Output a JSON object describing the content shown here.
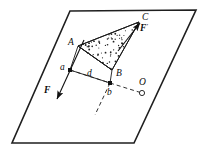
{
  "figure": {
    "background_color": "#ffffff",
    "stroke_color": "#1a1a1a",
    "canvas": {
      "width": 204,
      "height": 155
    }
  },
  "plane": {
    "name": "reference-plane",
    "shape": "parallelogram",
    "points": "70,11 196,10 134,143 12,143",
    "stroke_width": 1.6
  },
  "triangle": {
    "name": "triangle-ABC",
    "points": "78,46 112,70 139,22",
    "fill_pattern": "stipple",
    "stroke_width": 1.0
  },
  "quad": {
    "name": "quadrilateral-A-a-b-B",
    "points": "78,46 70,70 110,83 112,70",
    "stroke_width": 0.9
  },
  "points": [
    {
      "id": "A",
      "label": "A",
      "x": 78,
      "y": 46,
      "label_x": 68,
      "label_y": 45,
      "marker": "none"
    },
    {
      "id": "B",
      "label": "B",
      "x": 112,
      "y": 70,
      "label_x": 116,
      "label_y": 76,
      "marker": "none"
    },
    {
      "id": "C",
      "label": "C",
      "x": 139,
      "y": 22,
      "label_x": 142,
      "label_y": 20,
      "marker": "none"
    },
    {
      "id": "a",
      "label": "a",
      "x": 70,
      "y": 70,
      "label_x": 60,
      "label_y": 70,
      "marker": "filled-dot"
    },
    {
      "id": "b",
      "label": "b",
      "x": 110,
      "y": 83,
      "label_x": 107,
      "label_y": 95,
      "marker": "filled-dot"
    },
    {
      "id": "O",
      "label": "O",
      "x": 142,
      "y": 93,
      "label_x": 139,
      "label_y": 85,
      "marker": "open-circle"
    }
  ],
  "segments": {
    "distance_label": "d",
    "distance_label_x": 87,
    "distance_label_y": 76,
    "dashed_ab": {
      "name": "dashed-line-a-to-b",
      "x1": 70,
      "y1": 70,
      "x2": 110,
      "y2": 83
    },
    "dashed_bO": {
      "name": "dashed-line-b-to-O",
      "x1": 110,
      "y1": 83,
      "x2": 142,
      "y2": 93
    },
    "dashed_axis": {
      "name": "dashed-axis-below-b",
      "x1": 110,
      "y1": 83,
      "x2": 95,
      "y2": 115
    }
  },
  "vectors": [
    {
      "id": "F",
      "label": "F",
      "prime": "",
      "name": "force-vector-F",
      "tail_x": 84,
      "tail_y": 40,
      "head_x": 57,
      "head_y": 99,
      "label_x": 44,
      "label_y": 93,
      "direction": "down-left"
    },
    {
      "id": "Fprime",
      "label": "F",
      "prime": "'",
      "name": "force-vector-F-prime",
      "tail_x": 118,
      "tail_y": 51,
      "head_x": 140,
      "head_y": 23,
      "label_x": 140,
      "label_y": 31,
      "direction": "up-right"
    }
  ],
  "stipple": {
    "name": "stipple-fill",
    "dot_count": 60,
    "dot_radius": 0.7,
    "color": "#222222"
  }
}
